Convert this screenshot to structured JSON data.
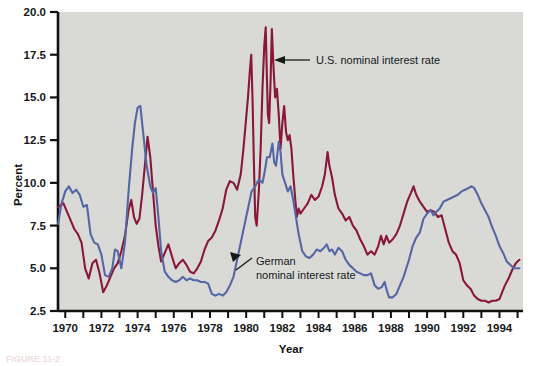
{
  "figure": {
    "caption": "FIGURE 11-2",
    "background": "#ffffff",
    "plot_background": "#d9dad6"
  },
  "axes": {
    "y_title": "Percent",
    "x_title": "Year",
    "y_ticks": [
      "2.5",
      "5.0",
      "7.5",
      "10.0",
      "12.5",
      "15.0",
      "17.5",
      "20.0"
    ],
    "x_ticks": [
      "1970",
      "1972",
      "1974",
      "1976",
      "1978",
      "1980",
      "1982",
      "1984",
      "1986",
      "1988",
      "1990",
      "1992",
      "1994"
    ]
  },
  "annotations": [
    {
      "id": "us-label",
      "text": "U.S. nominal interest rate",
      "line2": ""
    },
    {
      "id": "german-label",
      "text": "German",
      "line2": "nominal interest rate"
    }
  ],
  "colors": {
    "us_series": "#8a1738",
    "german_series": "#5566a5",
    "axis": "#101010",
    "plot_bg": "#d9dad6"
  },
  "chart_data": {
    "type": "line",
    "title": "",
    "xlabel": "Year",
    "ylabel": "Percent",
    "xlim": [
      1969.6,
      1995.3
    ],
    "ylim": [
      2.5,
      20.0
    ],
    "grid": false,
    "legend_position": "inline-annotations",
    "series": [
      {
        "name": "U.S. nominal interest rate",
        "color": "#8a1738",
        "points": [
          [
            1969.6,
            8.6
          ],
          [
            1969.9,
            8.8
          ],
          [
            1970.1,
            8.3
          ],
          [
            1970.3,
            7.8
          ],
          [
            1970.5,
            7.3
          ],
          [
            1970.7,
            7.0
          ],
          [
            1970.9,
            6.5
          ],
          [
            1971.1,
            5.0
          ],
          [
            1971.3,
            4.4
          ],
          [
            1971.5,
            5.3
          ],
          [
            1971.7,
            5.5
          ],
          [
            1971.9,
            4.7
          ],
          [
            1972.1,
            3.6
          ],
          [
            1972.3,
            4.0
          ],
          [
            1972.5,
            4.5
          ],
          [
            1972.7,
            5.0
          ],
          [
            1972.9,
            5.3
          ],
          [
            1973.1,
            6.0
          ],
          [
            1973.3,
            6.9
          ],
          [
            1973.5,
            8.4
          ],
          [
            1973.65,
            9.0
          ],
          [
            1973.8,
            8.0
          ],
          [
            1973.95,
            7.6
          ],
          [
            1974.1,
            7.9
          ],
          [
            1974.25,
            9.3
          ],
          [
            1974.4,
            11.0
          ],
          [
            1974.55,
            12.7
          ],
          [
            1974.7,
            11.5
          ],
          [
            1974.85,
            9.5
          ],
          [
            1975.0,
            7.5
          ],
          [
            1975.15,
            6.3
          ],
          [
            1975.3,
            5.4
          ],
          [
            1975.5,
            5.9
          ],
          [
            1975.7,
            6.4
          ],
          [
            1975.9,
            5.7
          ],
          [
            1976.1,
            5.0
          ],
          [
            1976.3,
            5.3
          ],
          [
            1976.5,
            5.5
          ],
          [
            1976.7,
            5.2
          ],
          [
            1976.9,
            4.8
          ],
          [
            1977.1,
            4.7
          ],
          [
            1977.3,
            5.0
          ],
          [
            1977.5,
            5.4
          ],
          [
            1977.7,
            6.1
          ],
          [
            1977.9,
            6.6
          ],
          [
            1978.1,
            6.8
          ],
          [
            1978.3,
            7.2
          ],
          [
            1978.5,
            7.8
          ],
          [
            1978.7,
            8.5
          ],
          [
            1978.9,
            9.6
          ],
          [
            1979.1,
            10.1
          ],
          [
            1979.3,
            10.0
          ],
          [
            1979.5,
            9.6
          ],
          [
            1979.7,
            10.5
          ],
          [
            1979.85,
            12.0
          ],
          [
            1980.0,
            13.8
          ],
          [
            1980.1,
            15.0
          ],
          [
            1980.2,
            16.5
          ],
          [
            1980.28,
            17.5
          ],
          [
            1980.35,
            15.0
          ],
          [
            1980.42,
            11.5
          ],
          [
            1980.5,
            8.0
          ],
          [
            1980.58,
            7.5
          ],
          [
            1980.7,
            9.5
          ],
          [
            1980.8,
            12.0
          ],
          [
            1980.9,
            15.5
          ],
          [
            1981.0,
            18.0
          ],
          [
            1981.08,
            19.1
          ],
          [
            1981.15,
            16.0
          ],
          [
            1981.2,
            14.0
          ],
          [
            1981.27,
            13.5
          ],
          [
            1981.35,
            16.0
          ],
          [
            1981.42,
            19.0
          ],
          [
            1981.5,
            17.0
          ],
          [
            1981.6,
            15.0
          ],
          [
            1981.7,
            15.5
          ],
          [
            1981.8,
            14.0
          ],
          [
            1981.9,
            12.0
          ],
          [
            1982.0,
            13.5
          ],
          [
            1982.1,
            14.5
          ],
          [
            1982.2,
            13.0
          ],
          [
            1982.3,
            12.5
          ],
          [
            1982.4,
            12.8
          ],
          [
            1982.5,
            12.0
          ],
          [
            1982.6,
            10.5
          ],
          [
            1982.7,
            9.2
          ],
          [
            1982.8,
            8.0
          ],
          [
            1982.9,
            8.5
          ],
          [
            1983.0,
            8.2
          ],
          [
            1983.2,
            8.5
          ],
          [
            1983.4,
            8.8
          ],
          [
            1983.6,
            9.3
          ],
          [
            1983.8,
            9.0
          ],
          [
            1984.0,
            9.2
          ],
          [
            1984.2,
            9.8
          ],
          [
            1984.35,
            10.5
          ],
          [
            1984.5,
            11.8
          ],
          [
            1984.6,
            11.0
          ],
          [
            1984.75,
            10.3
          ],
          [
            1984.9,
            9.3
          ],
          [
            1985.1,
            8.5
          ],
          [
            1985.3,
            8.2
          ],
          [
            1985.5,
            7.8
          ],
          [
            1985.7,
            8.0
          ],
          [
            1985.9,
            7.5
          ],
          [
            1986.1,
            7.2
          ],
          [
            1986.3,
            6.7
          ],
          [
            1986.5,
            6.3
          ],
          [
            1986.7,
            5.8
          ],
          [
            1986.9,
            6.0
          ],
          [
            1987.1,
            5.8
          ],
          [
            1987.3,
            6.3
          ],
          [
            1987.45,
            6.9
          ],
          [
            1987.6,
            6.4
          ],
          [
            1987.75,
            6.9
          ],
          [
            1987.9,
            6.5
          ],
          [
            1988.1,
            6.7
          ],
          [
            1988.3,
            7.0
          ],
          [
            1988.5,
            7.5
          ],
          [
            1988.7,
            8.2
          ],
          [
            1988.9,
            8.9
          ],
          [
            1989.1,
            9.4
          ],
          [
            1989.25,
            9.8
          ],
          [
            1989.4,
            9.3
          ],
          [
            1989.6,
            8.9
          ],
          [
            1989.8,
            8.6
          ],
          [
            1990.0,
            8.3
          ],
          [
            1990.2,
            8.4
          ],
          [
            1990.4,
            8.3
          ],
          [
            1990.6,
            8.0
          ],
          [
            1990.8,
            8.1
          ],
          [
            1991.0,
            7.3
          ],
          [
            1991.2,
            6.5
          ],
          [
            1991.4,
            6.0
          ],
          [
            1991.6,
            5.8
          ],
          [
            1991.8,
            5.3
          ],
          [
            1992.0,
            4.3
          ],
          [
            1992.2,
            4.0
          ],
          [
            1992.4,
            3.8
          ],
          [
            1992.6,
            3.4
          ],
          [
            1992.8,
            3.2
          ],
          [
            1993.0,
            3.1
          ],
          [
            1993.2,
            3.1
          ],
          [
            1993.4,
            3.0
          ],
          [
            1993.6,
            3.1
          ],
          [
            1993.8,
            3.1
          ],
          [
            1994.0,
            3.2
          ],
          [
            1994.15,
            3.6
          ],
          [
            1994.3,
            4.0
          ],
          [
            1994.5,
            4.4
          ],
          [
            1994.7,
            4.9
          ],
          [
            1994.9,
            5.3
          ],
          [
            1995.1,
            5.5
          ]
        ]
      },
      {
        "name": "German nominal interest rate",
        "color": "#5566a5",
        "points": [
          [
            1969.6,
            7.6
          ],
          [
            1969.8,
            8.8
          ],
          [
            1970.0,
            9.5
          ],
          [
            1970.2,
            9.8
          ],
          [
            1970.4,
            9.4
          ],
          [
            1970.6,
            9.6
          ],
          [
            1970.8,
            9.3
          ],
          [
            1971.0,
            8.6
          ],
          [
            1971.2,
            8.7
          ],
          [
            1971.4,
            7.0
          ],
          [
            1971.6,
            6.5
          ],
          [
            1971.8,
            6.4
          ],
          [
            1972.0,
            5.8
          ],
          [
            1972.2,
            4.6
          ],
          [
            1972.4,
            4.5
          ],
          [
            1972.6,
            5.0
          ],
          [
            1972.75,
            6.1
          ],
          [
            1972.9,
            6.0
          ],
          [
            1973.1,
            5.0
          ],
          [
            1973.3,
            6.5
          ],
          [
            1973.5,
            9.5
          ],
          [
            1973.7,
            12.0
          ],
          [
            1973.85,
            13.5
          ],
          [
            1974.0,
            14.4
          ],
          [
            1974.15,
            14.5
          ],
          [
            1974.3,
            13.0
          ],
          [
            1974.5,
            11.0
          ],
          [
            1974.7,
            9.8
          ],
          [
            1974.85,
            9.4
          ],
          [
            1975.0,
            9.7
          ],
          [
            1975.15,
            8.0
          ],
          [
            1975.3,
            6.0
          ],
          [
            1975.5,
            4.8
          ],
          [
            1975.7,
            4.5
          ],
          [
            1975.9,
            4.3
          ],
          [
            1976.1,
            4.2
          ],
          [
            1976.3,
            4.3
          ],
          [
            1976.5,
            4.5
          ],
          [
            1976.7,
            4.3
          ],
          [
            1976.9,
            4.4
          ],
          [
            1977.1,
            4.3
          ],
          [
            1977.3,
            4.3
          ],
          [
            1977.5,
            4.2
          ],
          [
            1977.7,
            4.2
          ],
          [
            1977.9,
            4.1
          ],
          [
            1978.1,
            3.5
          ],
          [
            1978.3,
            3.4
          ],
          [
            1978.5,
            3.5
          ],
          [
            1978.7,
            3.4
          ],
          [
            1978.9,
            3.6
          ],
          [
            1979.1,
            4.0
          ],
          [
            1979.3,
            4.5
          ],
          [
            1979.5,
            5.5
          ],
          [
            1979.7,
            6.5
          ],
          [
            1979.9,
            7.5
          ],
          [
            1980.1,
            8.5
          ],
          [
            1980.3,
            9.5
          ],
          [
            1980.5,
            9.8
          ],
          [
            1980.7,
            10.2
          ],
          [
            1980.9,
            10.0
          ],
          [
            1981.0,
            10.5
          ],
          [
            1981.15,
            11.5
          ],
          [
            1981.3,
            11.5
          ],
          [
            1981.45,
            12.3
          ],
          [
            1981.55,
            11.2
          ],
          [
            1981.65,
            11.0
          ],
          [
            1981.8,
            12.4
          ],
          [
            1981.9,
            11.8
          ],
          [
            1982.0,
            10.5
          ],
          [
            1982.15,
            10.0
          ],
          [
            1982.3,
            9.5
          ],
          [
            1982.45,
            9.8
          ],
          [
            1982.6,
            9.0
          ],
          [
            1982.75,
            8.0
          ],
          [
            1982.9,
            7.0
          ],
          [
            1983.1,
            6.0
          ],
          [
            1983.3,
            5.7
          ],
          [
            1983.5,
            5.6
          ],
          [
            1983.7,
            5.8
          ],
          [
            1983.9,
            6.1
          ],
          [
            1984.1,
            6.0
          ],
          [
            1984.3,
            6.2
          ],
          [
            1984.45,
            6.4
          ],
          [
            1984.6,
            6.0
          ],
          [
            1984.75,
            6.1
          ],
          [
            1984.9,
            5.8
          ],
          [
            1985.1,
            6.2
          ],
          [
            1985.3,
            6.0
          ],
          [
            1985.5,
            5.5
          ],
          [
            1985.7,
            5.2
          ],
          [
            1985.9,
            5.0
          ],
          [
            1986.1,
            4.8
          ],
          [
            1986.3,
            4.7
          ],
          [
            1986.5,
            4.6
          ],
          [
            1986.7,
            4.6
          ],
          [
            1986.9,
            4.7
          ],
          [
            1987.1,
            4.0
          ],
          [
            1987.3,
            3.8
          ],
          [
            1987.5,
            3.9
          ],
          [
            1987.65,
            4.2
          ],
          [
            1987.8,
            3.6
          ],
          [
            1987.9,
            3.3
          ],
          [
            1988.1,
            3.3
          ],
          [
            1988.3,
            3.5
          ],
          [
            1988.5,
            4.0
          ],
          [
            1988.7,
            4.5
          ],
          [
            1988.85,
            5.0
          ],
          [
            1989.0,
            5.5
          ],
          [
            1989.2,
            6.3
          ],
          [
            1989.4,
            6.8
          ],
          [
            1989.6,
            7.1
          ],
          [
            1989.8,
            7.9
          ],
          [
            1990.0,
            8.2
          ],
          [
            1990.2,
            8.4
          ],
          [
            1990.35,
            8.1
          ],
          [
            1990.5,
            8.3
          ],
          [
            1990.7,
            8.5
          ],
          [
            1990.9,
            8.9
          ],
          [
            1991.1,
            9.0
          ],
          [
            1991.3,
            9.1
          ],
          [
            1991.5,
            9.2
          ],
          [
            1991.7,
            9.3
          ],
          [
            1991.9,
            9.5
          ],
          [
            1992.1,
            9.6
          ],
          [
            1992.3,
            9.7
          ],
          [
            1992.45,
            9.8
          ],
          [
            1992.6,
            9.7
          ],
          [
            1992.8,
            9.3
          ],
          [
            1993.0,
            8.8
          ],
          [
            1993.2,
            8.4
          ],
          [
            1993.4,
            8.0
          ],
          [
            1993.6,
            7.4
          ],
          [
            1993.8,
            6.9
          ],
          [
            1994.0,
            6.3
          ],
          [
            1994.2,
            5.9
          ],
          [
            1994.4,
            5.4
          ],
          [
            1994.6,
            5.2
          ],
          [
            1994.8,
            5.0
          ],
          [
            1995.1,
            5.0
          ]
        ]
      }
    ]
  }
}
